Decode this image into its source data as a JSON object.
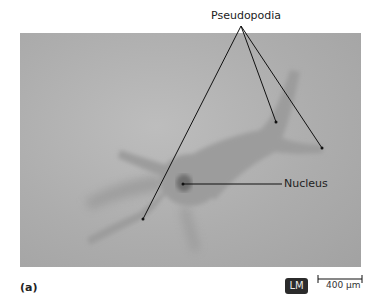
{
  "figure": {
    "panel_letter": "(a)",
    "labels": {
      "pseudopodia": "Pseudopodia",
      "nucleus": "Nucleus"
    },
    "microscopy_type": "LM",
    "scale_bar": "400 µm"
  }
}
